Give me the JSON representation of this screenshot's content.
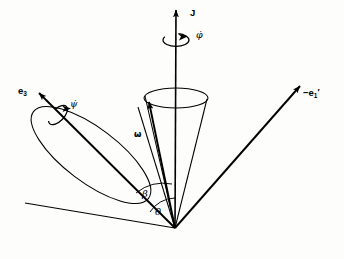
{
  "figure": {
    "background_color": "#fdfdfc",
    "stroke_color": "#000000",
    "width": 344,
    "height": 259,
    "apex": {
      "x": 175,
      "y": 228
    }
  },
  "labels": {
    "angular_momentum": "J",
    "body_axis": "e",
    "body_axis_sub": "3",
    "lab_axis": "−e",
    "lab_axis_sub": "1",
    "lab_axis_prime": "′",
    "angular_velocity": "ω",
    "angle_beta": "β",
    "angle_theta": "θ",
    "precession_rate": "φ̇",
    "spin_rate": "ψ̇"
  },
  "vectors": [
    {
      "name": "angular-momentum-J",
      "label": "J",
      "from": {
        "x": 175,
        "y": 228
      },
      "to": {
        "x": 176,
        "y": 8
      },
      "direction": "vertical-up",
      "arrowhead": true
    },
    {
      "name": "body-axis-e3",
      "label": "e3",
      "from": {
        "x": 175,
        "y": 228
      },
      "to": {
        "x": 37,
        "y": 91
      },
      "direction": "upper-left",
      "arrowhead": true
    },
    {
      "name": "lab-axis-minus-e1-prime",
      "label": "-e1'",
      "from": {
        "x": 175,
        "y": 228
      },
      "to": {
        "x": 302,
        "y": 84
      },
      "direction": "upper-right",
      "arrowhead": true
    },
    {
      "name": "angular-velocity-omega",
      "label": "ω",
      "from": {
        "x": 175,
        "y": 228
      },
      "to": {
        "x": 148,
        "y": 100
      },
      "direction": "upper-slightly-left",
      "arrowhead": true
    }
  ],
  "cones": [
    {
      "name": "space-cone",
      "description": "large outer cone, axis along J, rim is a tilted ellipse at upper left",
      "rim_center": {
        "x": 91,
        "y": 155
      },
      "rim_rx": 72,
      "rim_ry": 27,
      "rim_rotation_deg": 37
    },
    {
      "name": "body-cone",
      "description": "small inner cone, rim is a horizontal ellipse around the J axis",
      "rim_center": {
        "x": 176,
        "y": 98
      },
      "rim_rx": 32,
      "rim_ry": 10
    }
  ],
  "angle_arcs": [
    {
      "name": "beta-arc",
      "label": "β",
      "between": [
        "angular-velocity-omega",
        "body-axis-e3"
      ],
      "radius": 44
    },
    {
      "name": "theta-arc",
      "label": "θ",
      "between": [
        "angular-momentum-J",
        "angular-velocity-omega"
      ],
      "radius": 30
    }
  ],
  "rotation_indicators": [
    {
      "name": "precession-rate-phi-dot",
      "label": "φ̇",
      "about_axis": "angular-momentum-J",
      "center": {
        "x": 176,
        "y": 40
      },
      "description": "curved arrow encircling the vertical J axis"
    },
    {
      "name": "spin-rate-psi-dot",
      "label": "ψ̇",
      "about_axis": "body-axis-e3",
      "center": {
        "x": 58,
        "y": 115
      },
      "description": "curved arrow encircling the e3 body axis"
    }
  ]
}
